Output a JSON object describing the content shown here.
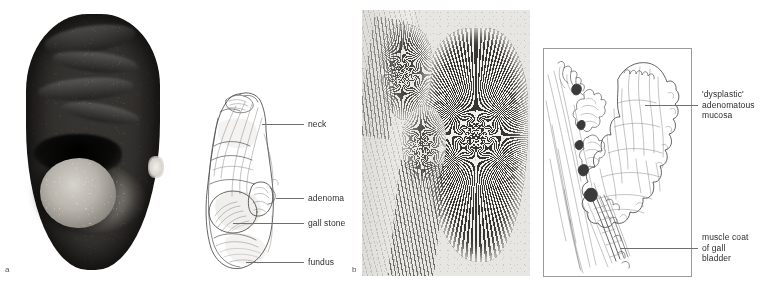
{
  "figure": {
    "background_color": "#ffffff",
    "panels": [
      {
        "letter": "a",
        "type": "gross-specimen-photograph-with-line-diagram",
        "description": "Opened gallbladder showing adenoma and gall stone"
      },
      {
        "letter": "b",
        "type": "histology-micrograph-with-line-diagram",
        "description": "Low power histology of gallbladder adenoma"
      }
    ]
  },
  "panel_a": {
    "letter": "a",
    "labels": [
      {
        "id": "neck",
        "text": "neck"
      },
      {
        "id": "adenoma",
        "text": "adenoma"
      },
      {
        "id": "gall-stone",
        "text": "gall stone"
      },
      {
        "id": "fundus",
        "text": "fundus"
      }
    ]
  },
  "panel_b": {
    "letter": "b",
    "labels": [
      {
        "id": "dysplastic-mucosa",
        "text": "'dysplastic'\nadenomatous\nmucosa"
      },
      {
        "id": "muscle-coat",
        "text": "muscle coat\nof gall\nbladder"
      }
    ]
  },
  "colors": {
    "leader_line": "#6f6f6f",
    "label_text": "#2e2e2e",
    "drawing_stroke": "#4a4a4a",
    "schema_border": "#9b9b9b",
    "histology_base": "#e7e6e2",
    "histology_epithelium": "#3b3936",
    "specimen_dark": "#2a2825",
    "specimen_stone": "#b4b0a8"
  }
}
